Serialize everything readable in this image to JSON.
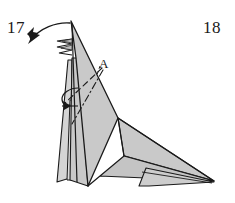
{
  "figure": {
    "kind": "origami-folding-diagram",
    "caption_absent": true,
    "step_numbers": {
      "left": "17",
      "right": "18"
    },
    "point_labels": [
      {
        "name": "A",
        "text": "A",
        "x": 99,
        "y": 57
      }
    ],
    "colors": {
      "paper_fill": "#c9c9c9",
      "paper_fill_light": "#d8d8d8",
      "paper_fill_shadow": "#b9b9b9",
      "outline": "#1a1a1a",
      "background": "#ffffff",
      "text": "#1a1a1a"
    },
    "annotations": {
      "fold_arrow_label": "valley-fold-arrow",
      "fold_arrow_description": "curved arrow sweeping from top spike down to the left",
      "small_arrow_label": "tuck-arrow",
      "small_arrow_description": "small hooked arrow at the left edge mid-height",
      "dashed_line_label": "valley-fold-line",
      "dash_dot_line_label": "mountain-fold-line",
      "pleat_label": "pleated-edge"
    },
    "geometry": {
      "apex": [
        71,
        21
      ],
      "junction": [
        118,
        118
      ],
      "wing_tip": [
        214,
        181
      ],
      "foot_left": [
        57,
        181
      ],
      "foot_right": [
        87,
        186
      ]
    }
  }
}
